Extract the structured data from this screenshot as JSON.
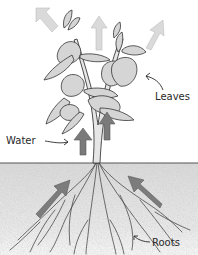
{
  "diagram": {
    "labels": {
      "leaves": "Leaves",
      "water": "Water",
      "roots": "Roots"
    },
    "colors": {
      "arrow_dark": "#7a7a7a",
      "arrow_light": "#d9d9d9",
      "leaf_fill": "#d8d8d8",
      "leaf_stroke": "#3a3a3a",
      "soil_fill": "#e4e4e4",
      "soil_line": "#555555",
      "background": "#ffffff"
    },
    "arrows": [
      {
        "name": "transpiration-arrow-left",
        "shade": "light",
        "direction": "up-left"
      },
      {
        "name": "transpiration-arrow-center",
        "shade": "light",
        "direction": "up"
      },
      {
        "name": "transpiration-arrow-right",
        "shade": "light",
        "direction": "up-right"
      },
      {
        "name": "stem-arrow-left",
        "shade": "dark",
        "direction": "up"
      },
      {
        "name": "stem-arrow-right",
        "shade": "dark",
        "direction": "up"
      },
      {
        "name": "soil-arrow-left",
        "shade": "dark",
        "direction": "up-right"
      },
      {
        "name": "soil-arrow-right",
        "shade": "dark",
        "direction": "up-left"
      }
    ]
  }
}
